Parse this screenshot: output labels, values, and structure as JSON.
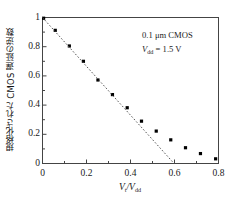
{
  "chart_data": {
    "type": "scatter",
    "title": "",
    "xlabel": "Vt/Vdd",
    "ylabel": "規格化された CMOS 遅延の逆数",
    "xlim": [
      0,
      0.8
    ],
    "ylim": [
      0,
      1
    ],
    "grid": false,
    "legend_position": "none",
    "x_ticks": [
      "0",
      "0.2",
      "0.4",
      "0.6",
      "0.8"
    ],
    "x_tick_values": [
      0,
      0.2,
      0.4,
      0.6,
      0.8
    ],
    "y_ticks": [
      "0",
      "0.2",
      "0.4",
      "0.6",
      "0.8",
      "1"
    ],
    "y_tick_values": [
      0,
      0.2,
      0.4,
      0.6,
      0.8,
      1
    ],
    "series": [
      {
        "name": "measured",
        "type": "scatter",
        "marker": "square",
        "color": "#000000",
        "x": [
          0.005,
          0.058,
          0.122,
          0.186,
          0.252,
          0.318,
          0.385,
          0.45,
          0.517,
          0.583,
          0.65,
          0.718,
          0.787
        ],
        "y": [
          0.995,
          0.912,
          0.805,
          0.7,
          0.572,
          0.472,
          0.382,
          0.29,
          0.222,
          0.162,
          0.108,
          0.068,
          0.032
        ]
      },
      {
        "name": "linear-extrapolation",
        "type": "line",
        "style": "dashed",
        "color": "#555555",
        "x": [
          0.0,
          0.598
        ],
        "y": [
          1.0,
          0.0
        ]
      }
    ],
    "annotations": [
      {
        "text": "0.1 μm CMOS",
        "x": 0.62,
        "y": 0.92
      },
      {
        "text": "Vdd = 1.5 V",
        "x": 0.62,
        "y": 0.82
      }
    ]
  },
  "labels": {
    "y_axis": "規格化された CMOS 遅延の逆数",
    "x_axis_num": "V",
    "x_axis_num_sub": "t",
    "x_axis_slash": "/",
    "x_axis_den": "V",
    "x_axis_den_sub": "dd",
    "annotation_process": "0.1 μm CMOS",
    "annotation_vdd_symbol": "V",
    "annotation_vdd_sub": "dd",
    "annotation_vdd_value": " = 1.5 V"
  },
  "colors": {
    "axis": "#444444",
    "marker": "#000000",
    "dashed_line": "#666666",
    "background": "#ffffff"
  }
}
